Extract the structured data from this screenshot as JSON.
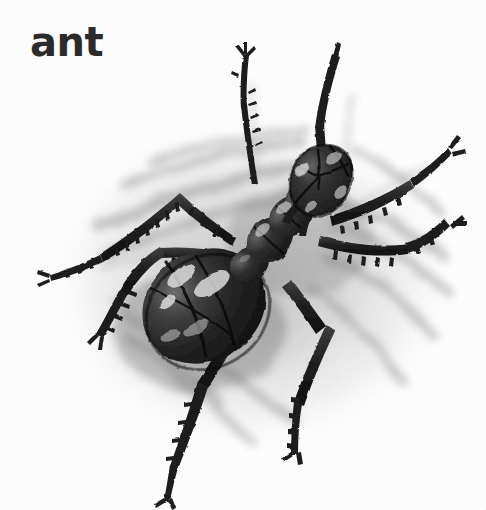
{
  "page": {
    "width": 486,
    "height": 510,
    "background_color": "#ffffff",
    "media": "pencil-drawing"
  },
  "caption": {
    "text": "ant",
    "color": "#2b2b2b"
  },
  "illustration": {
    "title": "ant",
    "subject": "ant",
    "view": "top-down",
    "style": "graphite pencil sketch on textured paper",
    "ink_color": "#1a1a1a",
    "shadow_color": "#9a9a9a",
    "paper_color": "#ffffff",
    "highlight_color": "#d8d8d8",
    "parts": [
      {
        "name": "head",
        "label": "head"
      },
      {
        "name": "thorax",
        "label": "thorax"
      },
      {
        "name": "petiole",
        "label": "petiole"
      },
      {
        "name": "gaster",
        "label": "abdomen"
      },
      {
        "name": "antenna-left",
        "label": "left antenna"
      },
      {
        "name": "antenna-right",
        "label": "right antenna"
      },
      {
        "name": "leg-front-left",
        "label": "front left leg"
      },
      {
        "name": "leg-middle-left",
        "label": "middle left leg"
      },
      {
        "name": "leg-hind-left",
        "label": "hind left leg"
      },
      {
        "name": "leg-front-right",
        "label": "front right leg"
      },
      {
        "name": "leg-middle-right",
        "label": "middle right leg"
      },
      {
        "name": "leg-hind-right",
        "label": "hind right leg"
      }
    ]
  }
}
